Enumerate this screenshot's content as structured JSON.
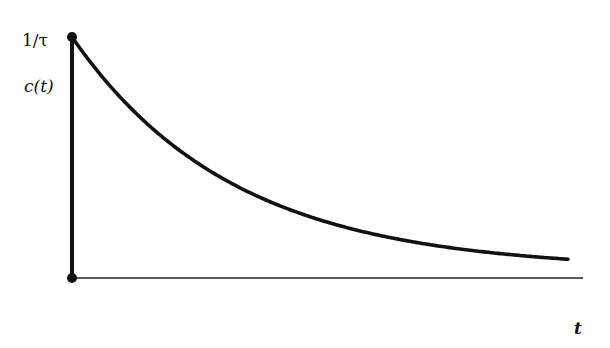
{
  "chart_data": {
    "type": "line",
    "title": "",
    "xlabel": "t",
    "ylabel": "c(t)",
    "y_tick_labels": [
      "1/τ"
    ],
    "grid": false,
    "legend": null,
    "series": [
      {
        "name": "c(t) = (1/τ)·e^(-t/τ)",
        "x_in_tau_units": [
          0,
          0.5,
          1,
          1.5,
          2,
          2.5,
          3,
          4,
          5,
          6
        ],
        "values_relative_to_1_over_tau": [
          1.0,
          0.61,
          0.37,
          0.22,
          0.14,
          0.08,
          0.05,
          0.02,
          0.007,
          0.002
        ]
      }
    ],
    "markers": [
      {
        "name": "origin-point",
        "x": 0,
        "y": 0
      },
      {
        "name": "initial-value-point",
        "x": 0,
        "y": "1/τ"
      }
    ],
    "ylim": [
      0,
      "1/τ"
    ],
    "colors": {
      "line": "#111111",
      "axis": "#111111",
      "background": "#ffffff"
    }
  },
  "labels": {
    "y_tick": "1/τ",
    "y_axis": "c(t)",
    "x_axis": "t"
  }
}
